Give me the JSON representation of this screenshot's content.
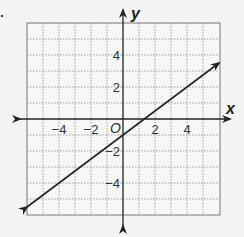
{
  "chart_data": {
    "type": "line",
    "title": "",
    "xlabel": "x",
    "ylabel": "y",
    "origin_label": "O",
    "xlim": [
      -6,
      6
    ],
    "ylim": [
      -6,
      6
    ],
    "grid": true,
    "grid_step": 1,
    "x_ticks": [
      -4,
      -2,
      2,
      4
    ],
    "y_ticks": [
      4,
      2,
      -2,
      -4
    ],
    "x_tick_labels": [
      "−4",
      "−2",
      "2",
      "4"
    ],
    "y_tick_labels": [
      "4",
      "2",
      "−2",
      "−4"
    ],
    "series": [
      {
        "name": "line",
        "equation": "y = (3/4)x - 1",
        "slope": 0.75,
        "intercept": -1,
        "x": [
          -6,
          6
        ],
        "y": [
          -5.5,
          3.5
        ],
        "arrows_both_ends": true
      }
    ],
    "colors": {
      "grid": "#8a8a8a",
      "frame": "#777777",
      "axis": "#222222",
      "line": "#222222",
      "background": "#f4f4f2"
    }
  }
}
